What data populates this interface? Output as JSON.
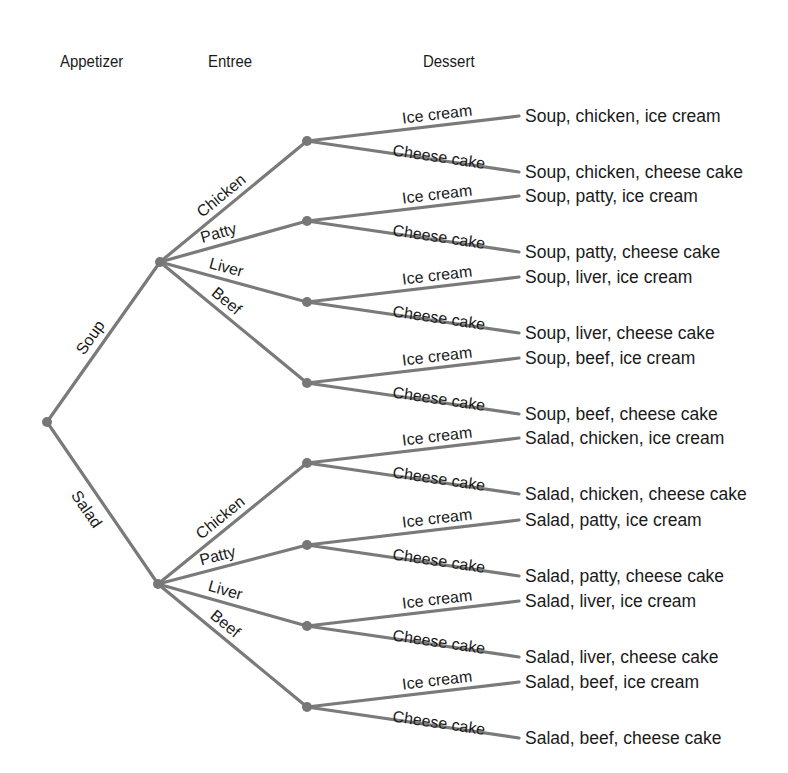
{
  "headers": {
    "appetizer": "Appetizer",
    "entree": "Entree",
    "dessert": "Dessert"
  },
  "colors": {
    "edge": "#7a7a7a",
    "node": "#777777",
    "text": "#1a1a1a",
    "background": "#ffffff"
  },
  "tree": {
    "appetizers": [
      {
        "label": "Soup",
        "entrees": [
          {
            "label": "Chicken",
            "desserts": [
              {
                "label": "Ice cream",
                "outcome": "Soup, chicken, ice cream"
              },
              {
                "label": "Cheese cake",
                "outcome": "Soup, chicken, cheese cake"
              }
            ]
          },
          {
            "label": "Patty",
            "desserts": [
              {
                "label": "Ice cream",
                "outcome": "Soup, patty, ice cream"
              },
              {
                "label": "Cheese cake",
                "outcome": "Soup, patty, cheese cake"
              }
            ]
          },
          {
            "label": "Liver",
            "desserts": [
              {
                "label": "Ice cream",
                "outcome": "Soup, liver, ice cream"
              },
              {
                "label": "Cheese cake",
                "outcome": "Soup, liver, cheese cake"
              }
            ]
          },
          {
            "label": "Beef",
            "desserts": [
              {
                "label": "Ice cream",
                "outcome": "Soup, beef, ice cream"
              },
              {
                "label": "Cheese cake",
                "outcome": "Soup, beef, cheese cake"
              }
            ]
          }
        ]
      },
      {
        "label": "Salad",
        "entrees": [
          {
            "label": "Chicken",
            "desserts": [
              {
                "label": "Ice cream",
                "outcome": "Salad, chicken, ice cream"
              },
              {
                "label": "Cheese cake",
                "outcome": "Salad, chicken, cheese cake"
              }
            ]
          },
          {
            "label": "Patty",
            "desserts": [
              {
                "label": "Ice cream",
                "outcome": "Salad, patty, ice cream"
              },
              {
                "label": "Cheese cake",
                "outcome": "Salad, patty, cheese cake"
              }
            ]
          },
          {
            "label": "Liver",
            "desserts": [
              {
                "label": "Ice cream",
                "outcome": "Salad, liver, ice cream"
              },
              {
                "label": "Cheese cake",
                "outcome": "Salad, liver, cheese cake"
              }
            ]
          },
          {
            "label": "Beef",
            "desserts": [
              {
                "label": "Ice cream",
                "outcome": "Salad, beef, ice cream"
              },
              {
                "label": "Cheese cake",
                "outcome": "Salad, beef, cheese cake"
              }
            ]
          }
        ]
      }
    ]
  }
}
